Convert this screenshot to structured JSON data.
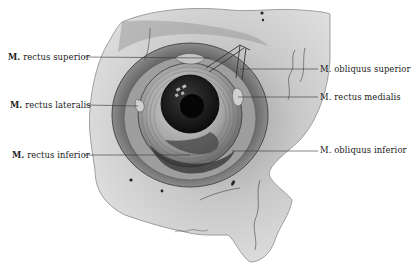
{
  "figure": {
    "labels_left": [
      {
        "prefix": "M.",
        "text": "rectus superior",
        "x": 8,
        "y": 52,
        "line_to": [
          210,
          58
        ]
      },
      {
        "prefix": "M.",
        "text": "rectus lateralis",
        "x": 10,
        "y": 100,
        "line_to": [
          138,
          106
        ]
      },
      {
        "prefix": "M.",
        "text": "rectus inferior",
        "x": 12,
        "y": 150,
        "line_to": [
          190,
          155
        ]
      }
    ],
    "labels_right": [
      {
        "prefix": "M.",
        "text": "obliquus superior",
        "x": 320,
        "y": 64,
        "line_from": [
          240,
          69
        ]
      },
      {
        "prefix": "M.",
        "text": "rectus medialis",
        "x": 320,
        "y": 92,
        "line_from": [
          238,
          97
        ]
      },
      {
        "prefix": "M.",
        "text": "obliquus inferior",
        "x": 320,
        "y": 145,
        "line_from": [
          232,
          151
        ]
      }
    ],
    "colors": {
      "background": "#ffffff",
      "bone_light": "#e4e4e4",
      "bone_mid": "#bdbdbd",
      "bone_dark": "#6a6a6a",
      "eye_dark": "#151515",
      "label_text": "#222222",
      "leader_line": "#333333"
    }
  }
}
